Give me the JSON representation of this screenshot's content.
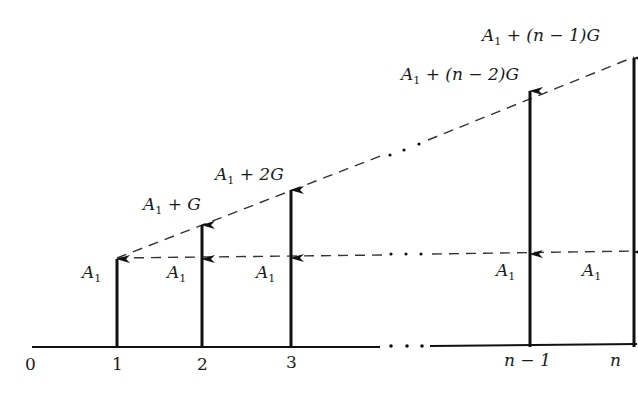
{
  "diagram": {
    "type": "cash-flow-diagram",
    "axis": {
      "tick_labels": [
        "0",
        "1",
        "2",
        "3",
        "n − 1",
        "n"
      ],
      "ellipsis": "• • •"
    },
    "base_amount_label": {
      "symbol": "A",
      "subscript": "1"
    },
    "top_labels": [
      {
        "period": "2",
        "prefix": "A",
        "sub": "1",
        "rest": " + G"
      },
      {
        "period": "3",
        "prefix": "A",
        "sub": "1",
        "rest": " + 2G"
      },
      {
        "period": "n − 1",
        "prefix": "A",
        "sub": "1",
        "rest": " + (n − 2)G"
      },
      {
        "period": "n",
        "prefix": "A",
        "sub": "1",
        "rest": " + (n − 1)G"
      }
    ],
    "colors": {
      "line": "#111111",
      "dash": "#333333",
      "background": "#ffffff"
    }
  }
}
